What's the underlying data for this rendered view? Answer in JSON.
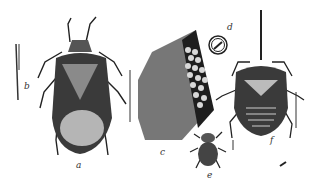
{
  "figure": {
    "labels": [
      {
        "id": "a",
        "text": "a",
        "x": 78,
        "y": 168,
        "subject": "adult bug"
      },
      {
        "id": "b",
        "text": "b",
        "x": 24,
        "y": 88,
        "subject": "beak/mouthpart"
      },
      {
        "id": "c",
        "text": "c",
        "x": 160,
        "y": 152,
        "subject": "egg mass on leaf"
      },
      {
        "id": "d",
        "text": "d",
        "x": 226,
        "y": 28,
        "subject": "single egg magnified"
      },
      {
        "id": "e",
        "text": "e",
        "x": 209,
        "y": 175,
        "subject": "young nymph"
      },
      {
        "id": "f",
        "text": "f",
        "x": 268,
        "y": 140,
        "subject": "older nymph"
      }
    ]
  }
}
